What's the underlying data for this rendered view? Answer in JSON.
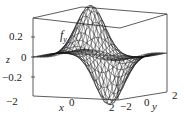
{
  "chart_data": {
    "type": "surface3d",
    "title": "",
    "annotation": "f_y",
    "function_label": {
      "main": "f",
      "subscript": "y"
    },
    "xlabel": "x",
    "ylabel": "y",
    "zlabel": "z",
    "x_range": [
      -2,
      2
    ],
    "y_range": [
      -2,
      2
    ],
    "z_range": [
      -0.3,
      0.35
    ],
    "x_ticks": [
      "-2",
      "0",
      "2"
    ],
    "y_ticks": [
      "-2",
      "0",
      "2"
    ],
    "z_ticks": [
      "-0.2",
      "0",
      "0.2"
    ],
    "grid": false,
    "box": true
  },
  "labels": {
    "z_tick_pos": "0.2",
    "z_tick_zero": "0",
    "z_tick_neg": "−0.2",
    "z_axis": "z",
    "func_main": "f",
    "func_sub": "y",
    "x_tick_min": "−2",
    "x_axis": "x",
    "x_tick_zero": "0",
    "x_tick_max": "2",
    "y_tick_min": "−2",
    "y_tick_zero": "0",
    "y_axis": "y",
    "y_tick_max": "2"
  }
}
